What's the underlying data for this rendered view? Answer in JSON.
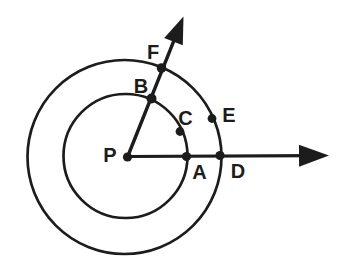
{
  "figure": {
    "canvas": {
      "width": 346,
      "height": 272
    },
    "background_color": "#ffffff",
    "ink_color": "#1c1c1c",
    "label_font_size": 20,
    "circles": [
      {
        "name": "inner-circle",
        "cx": 125.5,
        "cy": 156,
        "r": 62,
        "stroke_width": 2.7
      },
      {
        "name": "outer-circle",
        "cx": 124.5,
        "cy": 157,
        "r": 97,
        "stroke_width": 2.7
      }
    ],
    "rays": [
      {
        "name": "ray-through-A-D",
        "from": {
          "x": 127,
          "y": 156.5
        },
        "tip": {
          "x": 329,
          "y": 155.5
        },
        "stroke_width": 3.1,
        "arrow_length": 30,
        "arrow_half_width": 11
      },
      {
        "name": "ray-through-B-F",
        "from": {
          "x": 127.5,
          "y": 157
        },
        "tip": {
          "x": 183.5,
          "y": 16.5
        },
        "stroke_width": 3.4,
        "arrow_length": 27,
        "arrow_half_width": 10
      }
    ],
    "points": [
      {
        "label": "P",
        "x": 127.5,
        "y": 157,
        "dot_radius": 4.6,
        "label_x": 110,
        "label_y": 155
      },
      {
        "label": "A",
        "x": 186.5,
        "y": 156.5,
        "dot_radius": 4.6,
        "label_x": 199.5,
        "label_y": 171.5
      },
      {
        "label": "B",
        "x": 151.5,
        "y": 98.5,
        "dot_radius": 5.0,
        "label_x": 141,
        "label_y": 86
      },
      {
        "label": "C",
        "x": 180,
        "y": 131.5,
        "dot_radius": 4.4,
        "label_x": 185.5,
        "label_y": 117.5
      },
      {
        "label": "D",
        "x": 220,
        "y": 155.5,
        "dot_radius": 4.6,
        "label_x": 238,
        "label_y": 171
      },
      {
        "label": "E",
        "x": 212,
        "y": 118.5,
        "dot_radius": 4.4,
        "label_x": 229,
        "label_y": 114.5
      },
      {
        "label": "F",
        "x": 161.5,
        "y": 68,
        "dot_radius": 4.8,
        "label_x": 153,
        "label_y": 51.5
      }
    ]
  }
}
